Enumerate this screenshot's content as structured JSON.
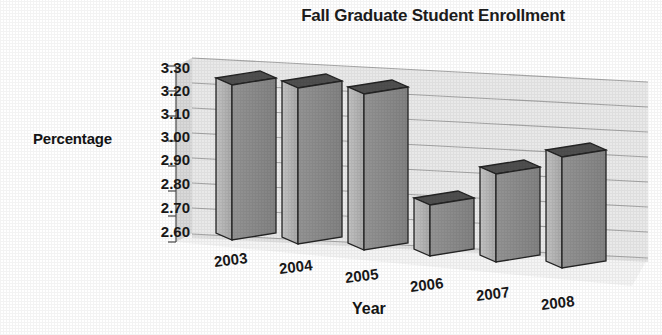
{
  "chart_data": {
    "type": "bar",
    "title": "Fall Graduate Student Enrollment",
    "xlabel": "Year",
    "ylabel": "Percentage",
    "categories": [
      "2003",
      "2004",
      "2005",
      "2006",
      "2007",
      "2008"
    ],
    "values": [
      3.22,
      3.22,
      3.21,
      2.73,
      2.85,
      2.93
    ],
    "ylim": [
      2.6,
      3.3
    ],
    "yticks": [
      "3.30",
      "3.20",
      "3.10",
      "3.00",
      "2.90",
      "2.80",
      "2.70",
      "2.60"
    ],
    "ytick_values": [
      3.3,
      3.2,
      3.1,
      3.0,
      2.9,
      2.8,
      2.7,
      2.6
    ],
    "grid": true,
    "legend": "none",
    "style": "3d-column",
    "colors": {
      "bar_front": "#b5b5b5",
      "bar_side": "#8c8c8c",
      "bar_top": "#4f4f4f",
      "bar_outline": "#2b2b2b",
      "wall_back": "#e9e9e9",
      "wall_side": "#d8d8d8",
      "floor": "#f4f4f4",
      "gridline": "#9a9a9a",
      "text": "#191919",
      "background": "#ffffff"
    }
  },
  "yticks_px": [
    {
      "label": "3.30",
      "x": 188,
      "y": 60
    },
    {
      "label": "3.20",
      "x": 188,
      "y": 83
    },
    {
      "label": "3.10",
      "x": 188,
      "y": 106
    },
    {
      "label": "3.00",
      "x": 188,
      "y": 129
    },
    {
      "label": "2.90",
      "x": 188,
      "y": 152
    },
    {
      "label": "2.80",
      "x": 188,
      "y": 176
    },
    {
      "label": "2.70",
      "x": 188,
      "y": 200
    },
    {
      "label": "2.60",
      "x": 188,
      "y": 224
    }
  ],
  "xticks_px": [
    {
      "label": "2003",
      "x": 214,
      "y": 251,
      "rotate": -7
    },
    {
      "label": "2004",
      "x": 279,
      "y": 258,
      "rotate": -7
    },
    {
      "label": "2005",
      "x": 345,
      "y": 267,
      "rotate": -7
    },
    {
      "label": "2006",
      "x": 410,
      "y": 276,
      "rotate": -7
    },
    {
      "label": "2007",
      "x": 476,
      "y": 285,
      "rotate": -7
    },
    {
      "label": "2008",
      "x": 541,
      "y": 294,
      "rotate": -7
    }
  ]
}
